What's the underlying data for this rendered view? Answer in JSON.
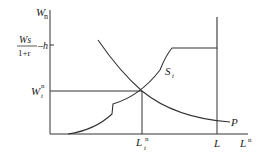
{
  "diagram": {
    "y_axis": {
      "label": "W",
      "label_sup": "n"
    },
    "x_axis": {
      "label": "L",
      "label_sup": "n"
    },
    "y_ticks": [
      {
        "numerator": "Ws",
        "denominator": "1+r",
        "suffix": "–h"
      },
      {
        "label": "W",
        "sub": "t",
        "sup": "n"
      }
    ],
    "x_ticks": [
      {
        "label": "L",
        "sub": "t",
        "sup": "n"
      },
      {
        "label": "L"
      }
    ],
    "curves": [
      {
        "name": "S",
        "sub": "t",
        "description": "supply curve"
      },
      {
        "name": "P",
        "description": "demand curve"
      }
    ],
    "colors": {
      "line": "#333333",
      "background": "#ffffff"
    }
  }
}
